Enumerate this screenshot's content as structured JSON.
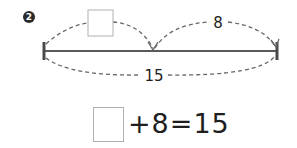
{
  "problem": {
    "number_badge": "2",
    "diagram": {
      "unknown_part_label": "",
      "known_part_label": "8",
      "total_label": "15"
    },
    "equation": {
      "blank": "",
      "text": "+8=15"
    }
  },
  "colors": {
    "line": "#555555",
    "dash": "#666666",
    "box_border": "#b0b0b0",
    "text": "#1e1e1e"
  }
}
